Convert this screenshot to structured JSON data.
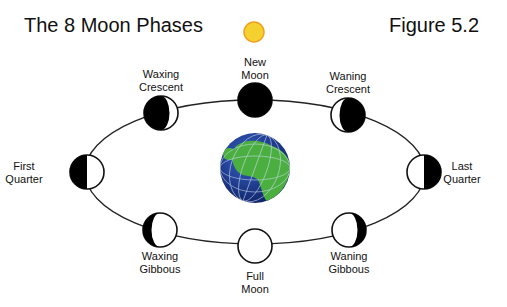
{
  "title": "The 8 Moon Phases",
  "figure_label": "Figure 5.2",
  "sun": {
    "name": "Sun",
    "color": "#f5d130",
    "outline": "#f0a020"
  },
  "earth": {
    "name": "Earth",
    "ocean_color": "#1e3c8c",
    "land_color": "#4cb040"
  },
  "phases": [
    {
      "key": "new-moon",
      "line1": "New",
      "line2": "Moon",
      "lit_fraction": 0,
      "lit_side": "none"
    },
    {
      "key": "waxing-crescent",
      "line1": "Waxing",
      "line2": "Crescent",
      "lit_fraction": 0.25,
      "lit_side": "right"
    },
    {
      "key": "first-quarter",
      "line1": "First",
      "line2": "Quarter",
      "lit_fraction": 0.5,
      "lit_side": "right"
    },
    {
      "key": "waxing-gibbous",
      "line1": "Waxing",
      "line2": "Gibbous",
      "lit_fraction": 0.75,
      "lit_side": "right"
    },
    {
      "key": "full-moon",
      "line1": "Full",
      "line2": "Moon",
      "lit_fraction": 1,
      "lit_side": "all"
    },
    {
      "key": "waning-gibbous",
      "line1": "Waning",
      "line2": "Gibbous",
      "lit_fraction": 0.75,
      "lit_side": "left"
    },
    {
      "key": "last-quarter",
      "line1": "Last",
      "line2": "Quarter",
      "lit_fraction": 0.5,
      "lit_side": "left"
    },
    {
      "key": "waning-crescent",
      "line1": "Waning",
      "line2": "Crescent",
      "lit_fraction": 0.25,
      "lit_side": "left"
    }
  ]
}
